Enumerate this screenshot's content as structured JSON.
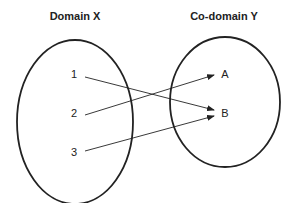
{
  "diagram": {
    "domain_title": "Domain X",
    "codomain_title": "Co-domain Y",
    "domain_elements": [
      "1",
      "2",
      "3"
    ],
    "codomain_elements": [
      "A",
      "B"
    ],
    "mappings": [
      {
        "from": "1",
        "to": "B"
      },
      {
        "from": "2",
        "to": "A"
      },
      {
        "from": "3",
        "to": "B"
      }
    ],
    "colors": {
      "stroke": "#222222",
      "background": "#ffffff"
    }
  }
}
